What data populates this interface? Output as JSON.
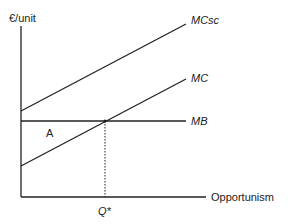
{
  "diagram": {
    "y_axis_label": "€/unit",
    "x_axis_label": "Opportunism",
    "curves": {
      "mcsc": {
        "label": "MCsc",
        "x1": 21,
        "y1": 111,
        "x2": 186,
        "y2": 24
      },
      "mc": {
        "label": "MC",
        "x1": 21,
        "y1": 166,
        "x2": 186,
        "y2": 79
      },
      "mb": {
        "label": "MB",
        "x1": 21,
        "y1": 121,
        "x2": 186,
        "y2": 121
      }
    },
    "area_label": "A",
    "equilibrium_label": "Q*",
    "colors": {
      "line": "#222222",
      "background": "#ffffff"
    }
  }
}
